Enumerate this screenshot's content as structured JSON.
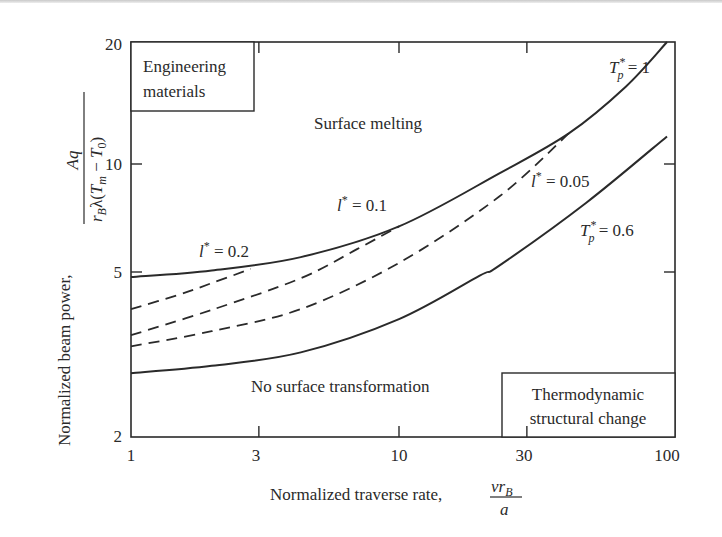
{
  "chart_data": {
    "type": "line",
    "title": "",
    "xlabel": "Normalized traverse rate,",
    "xlabel_fraction": {
      "numerator": "vr_B",
      "denominator": "a"
    },
    "ylabel": "Normalized beam power,",
    "ylabel_fraction": {
      "numerator": "Aq",
      "denominator": "r_B λ(T_m − T_0)"
    },
    "xscale": "log",
    "yscale": "log",
    "xlim": [
      1,
      100
    ],
    "ylim": [
      2,
      20
    ],
    "xticks": [
      1,
      3,
      10,
      30,
      100
    ],
    "yticks": [
      2,
      5,
      10,
      20
    ],
    "grid": false,
    "legend": "none (inline curve labels)",
    "series": [
      {
        "name": "T_p* = 1",
        "style": "solid",
        "x": [
          1,
          2,
          4.3,
          10,
          23.6,
          43,
          70,
          100
        ],
        "y": [
          4.86,
          5.05,
          5.5,
          6.7,
          9.4,
          11.9,
          15.5,
          20
        ]
      },
      {
        "name": "T_p* = 0.6",
        "style": "solid",
        "x": [
          1,
          2,
          4.3,
          10,
          20,
          23.6,
          50,
          100
        ],
        "y": [
          2.85,
          2.97,
          3.2,
          3.85,
          4.9,
          5.2,
          7.8,
          11.7
        ]
      },
      {
        "name": "l* = 0.2",
        "style": "dashed",
        "x": [
          1,
          1.5,
          2,
          2.8
        ],
        "y": [
          4.07,
          4.4,
          4.7,
          5.1
        ]
      },
      {
        "name": "l* = 0.1",
        "style": "dashed",
        "x": [
          1,
          2,
          4.3,
          7,
          10
        ],
        "y": [
          3.52,
          4.05,
          4.83,
          5.8,
          6.7
        ]
      },
      {
        "name": "l* = 0.05",
        "style": "dashed",
        "x": [
          1,
          2,
          4.3,
          10,
          23.6,
          43
        ],
        "y": [
          3.31,
          3.6,
          4.07,
          5.3,
          8.1,
          11.9
        ]
      }
    ],
    "annotations": [
      {
        "text": "Engineering materials",
        "type": "boxed",
        "position": "top-left"
      },
      {
        "text": "Surface melting",
        "position": "upper region"
      },
      {
        "text": "No surface transformation",
        "position": "lower region"
      },
      {
        "text": "Thermodynamic structural change",
        "type": "boxed",
        "position": "bottom-right"
      }
    ]
  },
  "labels": {
    "ytick_2": "2",
    "ytick_5": "5",
    "ytick_10": "10",
    "ytick_20": "20",
    "xtick_1": "1",
    "xtick_3": "3",
    "xtick_10": "10",
    "xtick_30": "30",
    "xtick_100": "100",
    "box_eng_line1": "Engineering",
    "box_eng_line2": "materials",
    "region_melting": "Surface melting",
    "region_none": "No surface transformation",
    "box_thermo_line1": "Thermodynamic",
    "box_thermo_line2": "structural change",
    "tp1_T": "T",
    "tp1_sub": "p",
    "tp1_sup": "*",
    "tp1_val": " = 1",
    "tp06_T": "T",
    "tp06_sub": "p",
    "tp06_sup": "*",
    "tp06_val": " = 0.6",
    "l02_l": "l",
    "l02_sup": "*",
    "l02_val": " = 0.2",
    "l01_l": "l",
    "l01_sup": "*",
    "l01_val": " = 0.1",
    "l005_l": "l",
    "l005_sup": "*",
    "l005_val": " = 0.05",
    "xlabel": "Normalized traverse rate,",
    "x_num_v": "vr",
    "x_num_sub": "B",
    "x_den": "a",
    "ylabel": "Normalized beam power,",
    "y_num": "Aq",
    "y_den_r": "r",
    "y_den_rsub": "B",
    "y_den_lam": "λ(",
    "y_den_T": "T",
    "y_den_Tsub": "m",
    "y_den_minus": " − ",
    "y_den_T0": "T",
    "y_den_T0sub": "0",
    "y_den_close": ")"
  }
}
